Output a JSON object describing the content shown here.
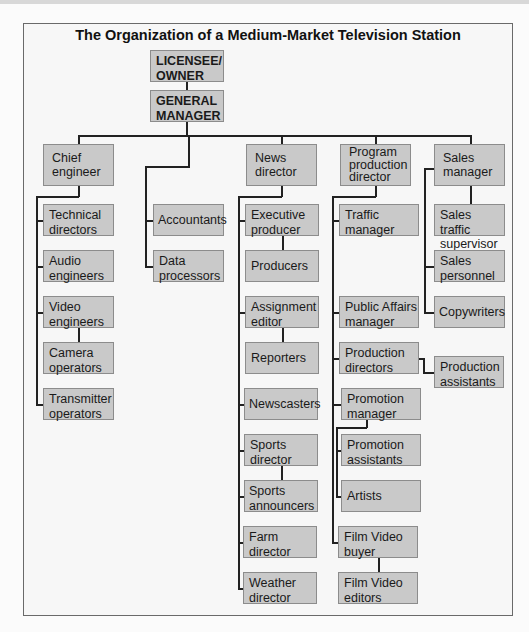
{
  "title": "The Organization of a Medium-Market Television Station",
  "colors": {
    "box_fill": "#c9c9c9",
    "box_border": "#8c8c8c",
    "line": "#222222",
    "background": "#f7f7f7"
  },
  "top": {
    "owner": "LICENSEE/ OWNER",
    "gm": "GENERAL MANAGER"
  },
  "engineering": {
    "head": "Chief engineer",
    "children": [
      "Technical directors",
      "Audio engineers",
      "Video engineers",
      "Camera operators",
      "Transmitter operators"
    ]
  },
  "accounting": {
    "children": [
      "Accountants",
      "Data processors"
    ]
  },
  "news": {
    "head": "News director",
    "children": [
      "Executive producer",
      "Producers",
      "Assignment editor",
      "Reporters",
      "Newscasters",
      "Sports director",
      "Sports announcers",
      "Farm director",
      "Weather director"
    ]
  },
  "program": {
    "head": "Program production director",
    "children": [
      "Traffic manager",
      "Public Affairs manager",
      "Production directors",
      "Production assistants",
      "Promotion manager",
      "Promotion assistants",
      "Artists",
      "Film Video buyer",
      "Film Video editors"
    ]
  },
  "sales": {
    "head": "Sales manager",
    "children": [
      "Sales traffic supervisor",
      "Sales personnel",
      "Copywriters"
    ]
  }
}
